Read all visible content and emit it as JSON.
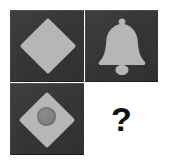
{
  "figure": {
    "kind": "visual-analogy-puzzle",
    "background_color": "#ffffff",
    "grid": {
      "rows": 2,
      "columns": 2,
      "missing_cell": "bottom-right"
    }
  },
  "colors": {
    "tile": "#353535",
    "shape_light": "#b6b6b6",
    "shape_mid": "#7d7d7d",
    "question_mark": "#111111",
    "background": "#ffffff"
  },
  "cells": [
    {
      "position": "top-left",
      "icon": "diamond-icon",
      "label": "diamond",
      "filled": true
    },
    {
      "position": "top-right",
      "icon": "bell-icon",
      "label": "bell",
      "filled": true
    },
    {
      "position": "bottom-left",
      "icon": "diamond-with-circle-icon",
      "label": "diamond with circle",
      "filled": true
    },
    {
      "position": "bottom-right",
      "icon": "question-mark-icon",
      "label": "?",
      "filled": false
    }
  ],
  "question": {
    "symbol": "?"
  }
}
